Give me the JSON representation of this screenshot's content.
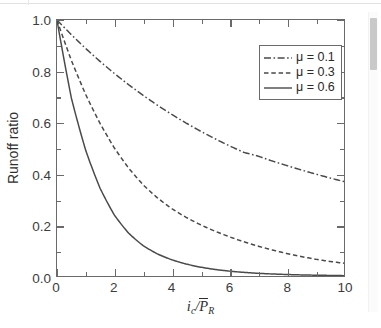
{
  "chart_data": {
    "type": "line",
    "title": "",
    "xlabel": "i_c/P̄_R",
    "xlabel_parts": {
      "numerator_var": "i",
      "numerator_sub": "c",
      "slash": "/",
      "denominator_var": "P",
      "denominator_sub": "R"
    },
    "ylabel": "Runoff ratio",
    "xlim": [
      0,
      10
    ],
    "ylim": [
      0,
      1
    ],
    "xticks": [
      0,
      2,
      4,
      6,
      8,
      10
    ],
    "xtick_labels": [
      "0",
      "2",
      "4",
      "6",
      "8",
      "10"
    ],
    "xticks_minor": [
      1,
      3,
      5,
      7,
      9
    ],
    "yticks": [
      0.0,
      0.2,
      0.4,
      0.6,
      0.8,
      1.0
    ],
    "ytick_labels": [
      "0.0",
      "0.2",
      "0.4",
      "0.6",
      "0.8",
      "1.0"
    ],
    "yticks_minor": [
      0.1,
      0.3,
      0.5,
      0.7,
      0.9
    ],
    "grid": false,
    "legend_position": "upper-right",
    "line_color": "#4a4a4a",
    "frame_color": "#6a6a6a",
    "series": [
      {
        "name": "μ = 0.1",
        "mu": 0.1,
        "style": "dashdot",
        "x": [
          0,
          0.5,
          1,
          1.5,
          2,
          2.5,
          3,
          3.5,
          4,
          4.5,
          5,
          5.5,
          6,
          6.5,
          7,
          7.5,
          8,
          8.5,
          9,
          9.5,
          10
        ],
        "values": [
          1.0,
          0.932,
          0.869,
          0.811,
          0.757,
          0.708,
          0.663,
          0.621,
          0.583,
          0.548,
          0.516,
          0.487,
          0.46,
          0.436,
          0.434,
          0.421,
          0.41,
          0.399,
          0.389,
          0.379,
          0.37
        ]
      },
      {
        "name": "μ = 0.3",
        "mu": 0.3,
        "style": "dashed",
        "x": [
          0,
          0.5,
          1,
          1.5,
          2,
          2.5,
          3,
          3.5,
          4,
          4.5,
          5,
          5.5,
          6,
          6.5,
          7,
          7.5,
          8,
          8.5,
          9,
          9.5,
          10
        ],
        "values": [
          1.0,
          0.82,
          0.67,
          0.545,
          0.44,
          0.358,
          0.295,
          0.25,
          0.217,
          0.192,
          0.172,
          0.155,
          0.139,
          0.124,
          0.11,
          0.097,
          0.085,
          0.074,
          0.064,
          0.056,
          0.05
        ]
      },
      {
        "name": "μ = 0.6",
        "mu": 0.6,
        "style": "solid",
        "x": [
          0,
          0.5,
          1,
          1.5,
          2,
          2.5,
          3,
          3.5,
          4,
          4.5,
          5,
          5.5,
          6,
          6.5,
          7,
          7.5,
          8,
          8.5,
          9,
          9.5,
          10
        ],
        "values": [
          1.0,
          0.64,
          0.42,
          0.265,
          0.16,
          0.098,
          0.062,
          0.042,
          0.03,
          0.022,
          0.016,
          0.012,
          0.009,
          0.007,
          0.005,
          0.004,
          0.003,
          0.002,
          0.0015,
          0.001,
          0.0
        ]
      }
    ]
  },
  "legend": {
    "items": [
      {
        "label": "μ = 0.1",
        "style": "dashdot"
      },
      {
        "label": "μ = 0.3",
        "style": "dashed"
      },
      {
        "label": "μ = 0.6",
        "style": "solid"
      }
    ]
  },
  "axes": {
    "ylabel": "Runoff ratio",
    "ytick_labels": [
      "1.0",
      "0.8",
      "0.6",
      "0.4",
      "0.2",
      "0.0"
    ],
    "xtick_labels": [
      "0",
      "2",
      "4",
      "6",
      "8",
      "10"
    ]
  },
  "scrollbar": {
    "visible": true
  }
}
